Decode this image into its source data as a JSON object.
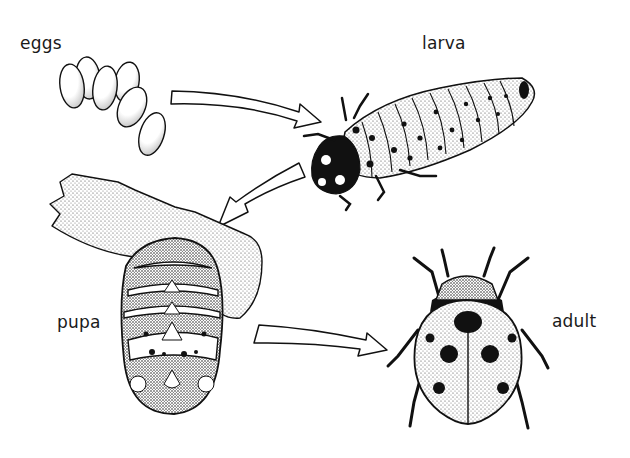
{
  "diagram": {
    "stages": [
      {
        "id": "eggs",
        "label": "eggs"
      },
      {
        "id": "larva",
        "label": "larva"
      },
      {
        "id": "pupa",
        "label": "pupa"
      },
      {
        "id": "adult",
        "label": "adult"
      }
    ],
    "arrows": [
      {
        "from": "eggs",
        "to": "larva"
      },
      {
        "from": "larva",
        "to": "pupa"
      },
      {
        "from": "pupa",
        "to": "adult"
      }
    ],
    "colors": {
      "ink": "#111111",
      "stipple": "#555555",
      "background": "#ffffff"
    }
  }
}
